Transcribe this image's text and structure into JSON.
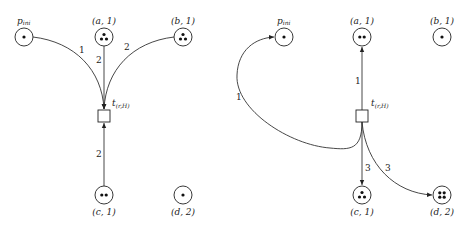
{
  "left_net": {
    "places": [
      {
        "id": "p_ini",
        "label": "p",
        "sub": "ini",
        "tokens": 1
      },
      {
        "id": "a1",
        "label": "(a, 1)",
        "tokens": 3
      },
      {
        "id": "b1",
        "label": "(b, 1)",
        "tokens": 3
      },
      {
        "id": "c1",
        "label": "(c, 1)",
        "tokens": 2
      },
      {
        "id": "d2",
        "label": "(d, 2)",
        "tokens": 1
      }
    ],
    "transition": {
      "label": "t",
      "sub": "(r,H)"
    },
    "arcs": [
      {
        "from": "p_ini",
        "to": "t",
        "weight": "1"
      },
      {
        "from": "a1",
        "to": "t",
        "weight": "2"
      },
      {
        "from": "b1",
        "to": "t",
        "weight": "2"
      },
      {
        "from": "c1",
        "to": "t",
        "weight": "2"
      }
    ]
  },
  "right_net": {
    "places": [
      {
        "id": "p_ini",
        "label": "p",
        "sub": "ini",
        "tokens": 1
      },
      {
        "id": "a1",
        "label": "(a, 1)",
        "tokens": 2
      },
      {
        "id": "b1",
        "label": "(b, 1)",
        "tokens": 1
      },
      {
        "id": "c1",
        "label": "(c, 1)",
        "tokens": 3
      },
      {
        "id": "d2",
        "label": "(d, 2)",
        "tokens": 4
      }
    ],
    "transition": {
      "label": "t",
      "sub": "(r,H)"
    },
    "arcs": [
      {
        "from": "t",
        "to": "p_ini",
        "weight": "1"
      },
      {
        "from": "t",
        "to": "a1",
        "weight": "1"
      },
      {
        "from": "t",
        "to": "c1",
        "weight": "3"
      },
      {
        "from": "t",
        "to": "d2",
        "weight": "3"
      }
    ]
  }
}
